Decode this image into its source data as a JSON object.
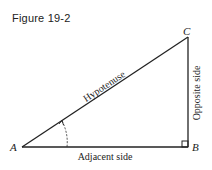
{
  "figure": {
    "title": "Figure 19-2"
  },
  "triangle": {
    "vertices": {
      "A": "A",
      "B": "B",
      "C": "C"
    },
    "sides": {
      "hypotenuse": "Hypotenuse",
      "adjacent": "Adjacent side",
      "opposite": "Opposite side"
    },
    "right_angle_at": "B",
    "marked_angle_at": "A",
    "stroke_color": "#222222"
  }
}
